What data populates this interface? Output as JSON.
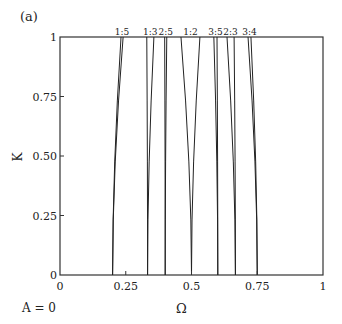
{
  "panel_label": "(a)",
  "parameter_label": "A = 0",
  "chart_data": {
    "type": "line",
    "title": "",
    "xlabel": "Ω",
    "ylabel": "K",
    "xlim": [
      0,
      1
    ],
    "ylim": [
      0,
      1
    ],
    "grid": false,
    "x_ticks": [
      "0",
      "0.25",
      "0.5",
      "0.75",
      "1"
    ],
    "x_tick_values": [
      0,
      0.25,
      0.5,
      0.75,
      1
    ],
    "y_ticks": [
      "0",
      "0.25",
      "0.50",
      "0.75",
      "1"
    ],
    "y_tick_values": [
      0,
      0.25,
      0.5,
      0.75,
      1
    ],
    "annotation": "A = 0",
    "series": [
      {
        "name": "1:5",
        "base_omega": 0.2,
        "top_left": 0.232,
        "top_right": 0.24
      },
      {
        "name": "1:3",
        "base_omega": 0.333,
        "top_left": 0.33,
        "top_right": 0.357
      },
      {
        "name": "2:5",
        "base_omega": 0.4,
        "top_left": 0.398,
        "top_right": 0.406
      },
      {
        "name": "1:2",
        "base_omega": 0.5,
        "top_left": 0.46,
        "top_right": 0.532
      },
      {
        "name": "3:5",
        "base_omega": 0.6,
        "top_left": 0.585,
        "top_right": 0.597
      },
      {
        "name": "2:3",
        "base_omega": 0.667,
        "top_left": 0.635,
        "top_right": 0.662
      },
      {
        "name": "3:4",
        "base_omega": 0.75,
        "top_left": 0.715,
        "top_right": 0.726
      }
    ]
  }
}
